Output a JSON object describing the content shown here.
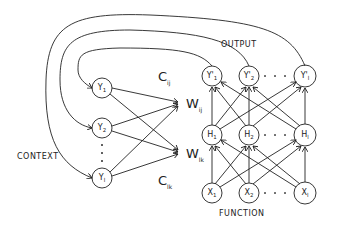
{
  "labels": {
    "output": "OUTPUT",
    "function": "FUNCTION",
    "context": "CONTEXT"
  },
  "weights": {
    "c_top": {
      "main": "C",
      "sub": "ij"
    },
    "c_bottom": {
      "main": "C",
      "sub": "lk"
    },
    "w_top": {
      "main": "W",
      "sub": "ij"
    },
    "w_bottom": {
      "main": "W",
      "sub": "lk"
    }
  },
  "context_nodes": [
    {
      "main": "Y",
      "sub": "1"
    },
    {
      "main": "Y",
      "sub": "2"
    },
    {
      "main": "Y",
      "sub": "l"
    }
  ],
  "output_nodes": [
    {
      "main": "Y'",
      "sub": "1"
    },
    {
      "main": "Y'",
      "sub": "2"
    },
    {
      "main": "Y'",
      "sub": "l"
    }
  ],
  "hidden_nodes": [
    {
      "main": "H",
      "sub": "1"
    },
    {
      "main": "H",
      "sub": "2"
    },
    {
      "main": "H",
      "sub": "l"
    }
  ],
  "input_nodes": [
    {
      "main": "X",
      "sub": "1"
    },
    {
      "main": "X",
      "sub": "2"
    },
    {
      "main": "X",
      "sub": "l"
    }
  ],
  "colors": {
    "ink": "#222222",
    "background": "#ffffff"
  }
}
